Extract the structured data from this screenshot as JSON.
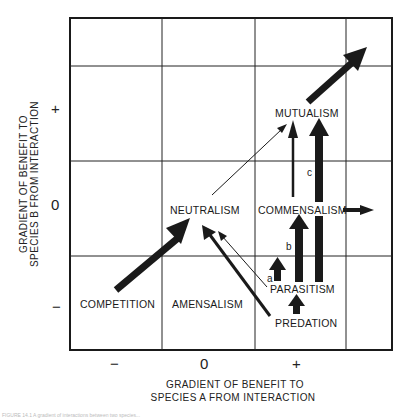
{
  "diagram": {
    "type": "interaction-gradient-grid",
    "grid": {
      "columns_x": [
        70,
        162,
        255,
        346,
        392
      ],
      "rows_y": [
        18,
        66,
        161,
        256,
        350
      ]
    },
    "x_axis": {
      "label_line1": "GRADIENT OF BENEFIT TO",
      "label_line2": "SPECIES A FROM INTERACTION",
      "ticks": [
        "−",
        "0",
        "+"
      ]
    },
    "y_axis": {
      "label_line1": "GRADIENT OF BENEFIT TO",
      "label_line2": "SPECIES B FROM INTERACTION",
      "ticks": [
        "+",
        "0",
        "−"
      ]
    },
    "nodes": {
      "mutualism": "MUTUALISM",
      "neutralism": "NEUTRALISM",
      "commensalism": "COMMENSALISM",
      "parasitism": "PARASITISM",
      "predation": "PREDATION",
      "competition": "COMPETITION",
      "amensalism": "AMENSALISM"
    },
    "arrow_labels": {
      "a": "a",
      "b": "b",
      "c": "c"
    },
    "colors": {
      "line": "#1a1a1a",
      "background": "#ffffff"
    }
  },
  "caption": {
    "text": "FIGURE 14.1  A gradient of interactions between two species..."
  }
}
